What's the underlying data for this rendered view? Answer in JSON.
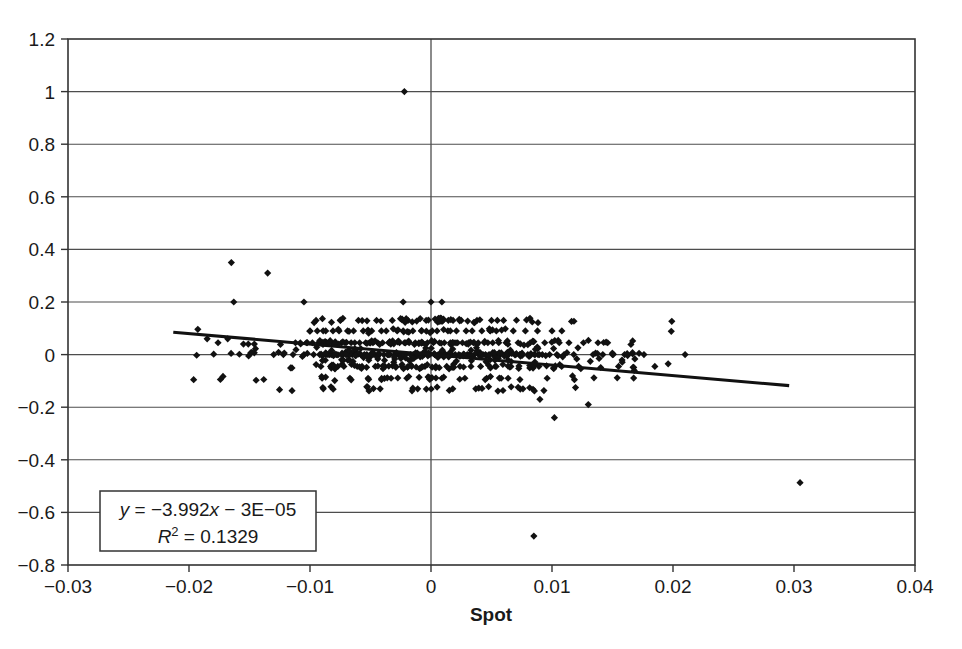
{
  "chart_data": {
    "type": "scatter",
    "title": "",
    "xlabel": "Spot",
    "ylabel": "",
    "xlim": [
      -0.03,
      0.04
    ],
    "ylim": [
      -0.8,
      1.2
    ],
    "grid": true,
    "legend": "none",
    "x_ticks": [
      -0.03,
      -0.02,
      -0.01,
      0,
      0.01,
      0.02,
      0.03,
      0.04
    ],
    "x_tick_labels": [
      "−0.03",
      "−0.02",
      "−0.01",
      "0",
      "0.01",
      "0.02",
      "0.03",
      "0.04"
    ],
    "y_ticks": [
      -0.8,
      -0.6,
      -0.4,
      -0.2,
      0,
      0.2,
      0.4,
      0.6,
      0.8,
      1,
      1.2
    ],
    "y_tick_labels": [
      "−0.8",
      "−0.6",
      "−0.4",
      "−0.2",
      "0",
      "0.2",
      "0.4",
      "0.6",
      "0.8",
      "1",
      "1.2"
    ],
    "annotation": {
      "equation": "y = −3.992x − 3E−05",
      "equation_parts": {
        "y_symbol": "y",
        "rest": " = −3.992",
        "x_symbol": "x",
        "tail": " − 3E−05"
      },
      "r_squared": "R² = 0.1329",
      "r_squared_parts": {
        "r_symbol": "R",
        "exponent": "2",
        "value": " = 0.1329"
      }
    },
    "trendline": {
      "slope": -3.992,
      "intercept": -3e-05,
      "x_start": -0.0213,
      "x_end": 0.0296,
      "y_start": 0.085,
      "y_end": -0.118
    },
    "marker_style": "diamond",
    "marker_color": "#111111",
    "n_points": 486,
    "points": [
      [
        -0.0022,
        1.0
      ],
      [
        -0.0165,
        0.35
      ],
      [
        -0.0135,
        0.31
      ],
      [
        -0.0163,
        0.2
      ],
      [
        -0.0105,
        0.2
      ],
      [
        -0.0023,
        0.2
      ],
      [
        0.0009,
        0.2
      ],
      [
        0.0085,
        -0.69
      ],
      [
        0.0305,
        -0.487
      ],
      [
        -0.0185,
        0.06
      ],
      [
        -0.0176,
        0.045
      ],
      [
        -0.0168,
        0.06
      ],
      [
        -0.0155,
        0.04
      ],
      [
        -0.0151,
        0.04
      ],
      [
        -0.0146,
        0.04
      ],
      [
        -0.013,
        0.0
      ],
      [
        -0.0122,
        0.0
      ],
      [
        -0.0114,
        0.0
      ],
      [
        -0.0112,
        0.045
      ],
      [
        -0.0108,
        0.045
      ],
      [
        -0.0105,
        0.0
      ],
      [
        -0.0103,
        0.045
      ],
      [
        -0.01,
        0.09
      ],
      [
        -0.0098,
        0.045
      ],
      [
        -0.0097,
        0.0
      ],
      [
        -0.0095,
        0.13
      ],
      [
        -0.0094,
        0.09
      ],
      [
        -0.0093,
        0.045
      ],
      [
        -0.0092,
        0.0
      ],
      [
        -0.0091,
        -0.045
      ],
      [
        -0.009,
        -0.09
      ],
      [
        -0.0089,
        -0.13
      ],
      [
        -0.0088,
        0.045
      ],
      [
        -0.0087,
        0.09
      ],
      [
        -0.0086,
        0.0
      ],
      [
        -0.0085,
        0.045
      ],
      [
        -0.0084,
        0.0
      ],
      [
        -0.0083,
        -0.045
      ],
      [
        -0.0082,
        0.045
      ],
      [
        -0.0081,
        0.09
      ],
      [
        -0.008,
        0.0
      ],
      [
        -0.0079,
        0.045
      ],
      [
        -0.0078,
        0.0
      ],
      [
        -0.0077,
        -0.045
      ],
      [
        -0.0076,
        0.09
      ],
      [
        -0.0075,
        0.13
      ],
      [
        -0.0074,
        0.045
      ],
      [
        -0.0073,
        0.0
      ],
      [
        -0.0072,
        -0.045
      ],
      [
        -0.0071,
        0.045
      ],
      [
        -0.007,
        0.0
      ],
      [
        -0.0069,
        0.09
      ],
      [
        -0.0068,
        0.0
      ],
      [
        -0.0067,
        -0.09
      ],
      [
        -0.0066,
        0.045
      ],
      [
        -0.0065,
        0.0
      ],
      [
        -0.0064,
        0.09
      ],
      [
        -0.0063,
        0.045
      ],
      [
        -0.0062,
        0.0
      ],
      [
        -0.0061,
        -0.045
      ],
      [
        -0.006,
        0.13
      ],
      [
        -0.0059,
        0.045
      ],
      [
        -0.0058,
        0.0
      ],
      [
        -0.0057,
        -0.045
      ],
      [
        -0.0056,
        0.09
      ],
      [
        -0.0055,
        0.0
      ],
      [
        -0.0054,
        0.045
      ],
      [
        -0.0053,
        0.0
      ],
      [
        -0.0052,
        -0.09
      ],
      [
        -0.0051,
        0.045
      ],
      [
        -0.005,
        0.0
      ],
      [
        -0.0049,
        0.09
      ],
      [
        -0.0048,
        0.045
      ],
      [
        -0.0047,
        0.0
      ],
      [
        -0.0046,
        -0.045
      ],
      [
        -0.0045,
        0.13
      ],
      [
        -0.0044,
        0.045
      ],
      [
        -0.0043,
        0.0
      ],
      [
        -0.0042,
        -0.13
      ],
      [
        -0.0041,
        0.09
      ],
      [
        -0.004,
        0.045
      ],
      [
        -0.0039,
        0.0
      ],
      [
        -0.0038,
        -0.045
      ],
      [
        -0.0037,
        0.09
      ],
      [
        -0.0036,
        0.0
      ],
      [
        -0.0035,
        0.045
      ],
      [
        -0.0034,
        0.0
      ],
      [
        -0.0033,
        -0.09
      ],
      [
        -0.0032,
        0.13
      ],
      [
        -0.0031,
        0.045
      ],
      [
        -0.003,
        0.0
      ],
      [
        -0.0029,
        -0.045
      ],
      [
        -0.0028,
        0.09
      ],
      [
        -0.0027,
        0.0
      ],
      [
        -0.0026,
        0.045
      ],
      [
        -0.0025,
        0.0
      ],
      [
        -0.0024,
        -0.045
      ],
      [
        -0.0023,
        0.09
      ],
      [
        -0.0022,
        0.045
      ],
      [
        -0.0021,
        0.0
      ],
      [
        -0.002,
        -0.09
      ],
      [
        -0.0019,
        0.13
      ],
      [
        -0.0018,
        0.045
      ],
      [
        -0.0017,
        0.0
      ],
      [
        -0.0016,
        -0.045
      ],
      [
        -0.0015,
        0.09
      ],
      [
        -0.0014,
        0.0
      ],
      [
        -0.0013,
        0.045
      ],
      [
        -0.0012,
        0.0
      ],
      [
        -0.0011,
        -0.13
      ],
      [
        -0.001,
        0.045
      ],
      [
        -0.0009,
        0.0
      ],
      [
        -0.0008,
        0.09
      ],
      [
        -0.0007,
        0.045
      ],
      [
        -0.0006,
        0.0
      ],
      [
        -0.0005,
        -0.045
      ],
      [
        -0.0004,
        0.13
      ],
      [
        -0.0003,
        0.045
      ],
      [
        -0.0002,
        0.0
      ],
      [
        -0.0001,
        -0.09
      ],
      [
        0.0,
        0.2
      ],
      [
        0.0001,
        0.09
      ],
      [
        0.0002,
        0.045
      ],
      [
        0.0003,
        0.0
      ],
      [
        0.0004,
        -0.045
      ],
      [
        0.0005,
        0.09
      ],
      [
        0.0006,
        0.0
      ],
      [
        0.0007,
        0.045
      ],
      [
        0.0008,
        0.0
      ],
      [
        0.0009,
        -0.09
      ],
      [
        0.001,
        0.13
      ],
      [
        0.0011,
        0.045
      ],
      [
        0.0012,
        0.0
      ],
      [
        0.0013,
        -0.045
      ],
      [
        0.0014,
        0.09
      ],
      [
        0.0015,
        0.0
      ],
      [
        0.0016,
        0.045
      ],
      [
        0.0017,
        0.0
      ],
      [
        0.0018,
        -0.13
      ],
      [
        0.0019,
        0.045
      ],
      [
        0.002,
        0.0
      ],
      [
        0.0021,
        0.09
      ],
      [
        0.0022,
        0.045
      ],
      [
        0.0023,
        0.0
      ],
      [
        0.0024,
        -0.045
      ],
      [
        0.0025,
        0.13
      ],
      [
        0.0026,
        0.045
      ],
      [
        0.0027,
        0.0
      ],
      [
        0.0028,
        -0.09
      ],
      [
        0.0029,
        0.09
      ],
      [
        0.003,
        0.0
      ],
      [
        0.0031,
        0.045
      ],
      [
        0.0032,
        0.0
      ],
      [
        0.0033,
        -0.045
      ],
      [
        0.0034,
        0.09
      ],
      [
        0.0035,
        0.045
      ],
      [
        0.0036,
        0.0
      ],
      [
        0.0037,
        -0.13
      ],
      [
        0.0038,
        0.13
      ],
      [
        0.0039,
        0.045
      ],
      [
        0.004,
        0.0
      ],
      [
        0.0041,
        -0.045
      ],
      [
        0.0042,
        0.09
      ],
      [
        0.0043,
        0.0
      ],
      [
        0.0044,
        0.045
      ],
      [
        0.0045,
        0.0
      ],
      [
        0.0046,
        -0.09
      ],
      [
        0.0047,
        0.045
      ],
      [
        0.0048,
        0.0
      ],
      [
        0.0049,
        0.09
      ],
      [
        0.005,
        0.13
      ],
      [
        0.0051,
        0.045
      ],
      [
        0.0052,
        0.0
      ],
      [
        0.0053,
        -0.045
      ],
      [
        0.0054,
        0.09
      ],
      [
        0.0055,
        0.0
      ],
      [
        0.0056,
        0.045
      ],
      [
        0.0057,
        0.0
      ],
      [
        0.0058,
        -0.09
      ],
      [
        0.006,
        0.13
      ],
      [
        0.0062,
        0.045
      ],
      [
        0.0064,
        0.0
      ],
      [
        0.0066,
        -0.045
      ],
      [
        0.0068,
        0.09
      ],
      [
        0.007,
        0.0
      ],
      [
        0.0072,
        0.045
      ],
      [
        0.0074,
        0.0
      ],
      [
        0.0076,
        -0.13
      ],
      [
        0.0078,
        0.09
      ],
      [
        0.008,
        0.0
      ],
      [
        0.0082,
        0.045
      ],
      [
        0.0084,
        -0.045
      ],
      [
        0.0086,
        0.0
      ],
      [
        0.0088,
        0.09
      ],
      [
        0.009,
        -0.17
      ],
      [
        0.0092,
        0.0
      ],
      [
        0.0094,
        0.045
      ],
      [
        0.0096,
        -0.09
      ],
      [
        0.0098,
        0.0
      ],
      [
        0.01,
        0.09
      ],
      [
        0.0102,
        -0.24
      ],
      [
        0.0104,
        0.0
      ],
      [
        0.0106,
        0.045
      ],
      [
        0.0108,
        -0.045
      ],
      [
        0.011,
        0.0
      ],
      [
        0.0114,
        0.045
      ],
      [
        0.0118,
        0.0
      ],
      [
        0.0122,
        -0.045
      ],
      [
        0.0126,
        0.045
      ],
      [
        0.013,
        -0.19
      ],
      [
        0.0134,
        0.0
      ],
      [
        0.0138,
        0.045
      ],
      [
        0.0142,
        0.0
      ],
      [
        0.0146,
        0.045
      ],
      [
        0.015,
        0.0
      ],
      [
        0.0155,
        -0.045
      ],
      [
        0.016,
        0.0
      ],
      [
        0.0168,
        -0.06
      ],
      [
        0.0176,
        0.0
      ],
      [
        0.0185,
        -0.045
      ],
      [
        0.0196,
        -0.035
      ],
      [
        0.021,
        0.0
      ]
    ]
  }
}
